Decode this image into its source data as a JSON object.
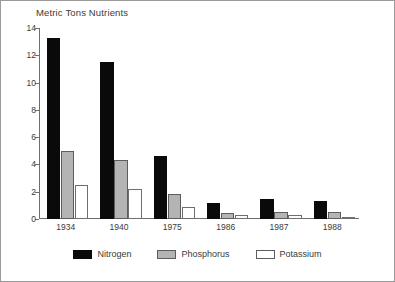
{
  "chart_data": {
    "type": "bar",
    "title": "Metric Tons Nutrients",
    "xlabel": "",
    "ylabel": "",
    "ylim": [
      0,
      14
    ],
    "yticks": [
      0,
      2,
      4,
      6,
      8,
      10,
      12,
      14
    ],
    "grid": false,
    "legend_position": "bottom",
    "categories": [
      "1934",
      "1940",
      "1975",
      "1986",
      "1987",
      "1988"
    ],
    "series": [
      {
        "name": "Nitrogen",
        "color": "#0a0a0a",
        "values": [
          13.3,
          11.5,
          4.6,
          1.2,
          1.5,
          1.3
        ]
      },
      {
        "name": "Phosphorus",
        "color": "#b4b4b4",
        "values": [
          5.0,
          4.3,
          1.8,
          0.45,
          0.5,
          0.5
        ]
      },
      {
        "name": "Potassium",
        "color": "#ffffff",
        "values": [
          2.5,
          2.2,
          0.9,
          0.3,
          0.3,
          0.15
        ]
      }
    ]
  }
}
